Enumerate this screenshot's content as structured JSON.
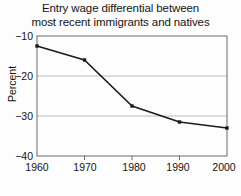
{
  "chart_data": {
    "type": "line",
    "title": "Entry wage differential between most recent immigrants and natives",
    "title_lines": [
      "Entry wage differential between",
      "most recent immigrants and natives"
    ],
    "xlabel": "Year of Entry",
    "ylabel": "Percent",
    "x": [
      1960,
      1970,
      1980,
      1990,
      2000
    ],
    "values": [
      -12.5,
      -16.0,
      -27.5,
      -31.5,
      -33.0
    ],
    "categories": [
      "1960",
      "1970",
      "1980",
      "1990",
      "2000"
    ],
    "xtick_labels": [
      "1960",
      "1970",
      "1980",
      "1990",
      "2000"
    ],
    "ytick_labels": [
      "−10",
      "−20",
      "−30",
      "−40"
    ],
    "ytick_values": [
      -10,
      -20,
      -30,
      -40
    ],
    "xlim": [
      1960,
      2000
    ],
    "ylim": [
      -40,
      -10
    ],
    "grid": true,
    "grid_axis": "y",
    "legend": "none",
    "marker": "square",
    "line_color": "#1a1a1a",
    "grid_color": "#b9b9b9",
    "axis_color": "#555555",
    "background": "#fdfdfd"
  }
}
